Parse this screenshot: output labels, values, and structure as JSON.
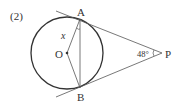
{
  "problem": {
    "number_label": "(2)"
  },
  "diagram": {
    "points": {
      "A": "A",
      "B": "B",
      "O": "O",
      "P": "P"
    },
    "variable_label": "x",
    "angle_label": "48°",
    "angle_value_degrees": 48
  }
}
